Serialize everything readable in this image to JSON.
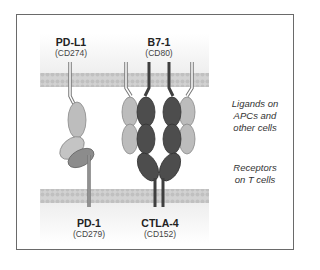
{
  "ligands": [
    {
      "name": "PD-L1",
      "cd": "(CD274)"
    },
    {
      "name": "B7-1",
      "cd": "(CD80)"
    }
  ],
  "receptors": [
    {
      "name": "PD-1",
      "cd": "(CD279)"
    },
    {
      "name": "CTLA-4",
      "cd": "(CD152)"
    }
  ],
  "annotations": {
    "ligands_note": [
      "Ligands on",
      "APCs and",
      "other cells"
    ],
    "receptors_note": [
      "Receptors",
      "on T cells"
    ]
  },
  "colors": {
    "light_domain": "#b9b9b9",
    "medium_domain": "#8a8a8a",
    "dark_domain": "#4b4b4b",
    "membrane": "#c9c9c9",
    "membrane_region": "#f1f1f1",
    "frame": "#6a6a6a"
  }
}
